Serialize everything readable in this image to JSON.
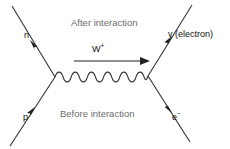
{
  "diagram": {
    "phase_labels": {
      "after": "After interaction",
      "before": "Before interaction"
    },
    "boson": {
      "symbol": "W",
      "charge": "+",
      "direction": "right"
    },
    "particles": [
      {
        "id": "neutron",
        "label": "n",
        "position": "upper-left",
        "arrow": "outgoing-up-left"
      },
      {
        "id": "neutrino",
        "label": "v (electron)",
        "position": "upper-right",
        "arrow": "outgoing-up-right"
      },
      {
        "id": "proton",
        "label": "p",
        "position": "lower-left",
        "arrow": "incoming-up-right"
      },
      {
        "id": "electron",
        "label": "e",
        "superscript": "−",
        "position": "lower-right",
        "arrow": "incoming-down-right"
      }
    ],
    "colors": {
      "line": "#333333",
      "text": "#111111",
      "phase_text": "#6e6e6e",
      "background": "#ffffff"
    }
  }
}
